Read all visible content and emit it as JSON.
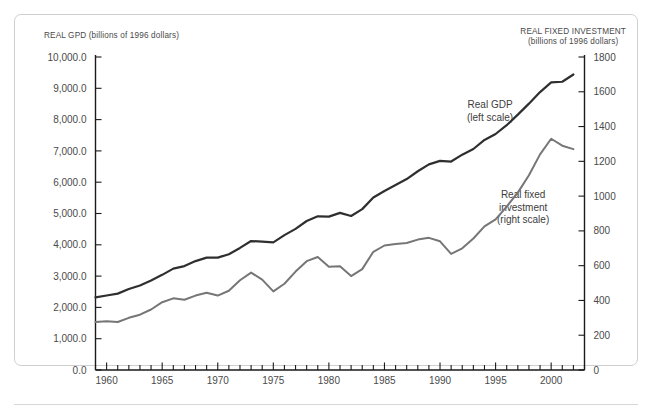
{
  "figure": {
    "left_axis_caption": "REAL GPD (billions of 1996 dollars)",
    "right_axis_caption_line1": "REAL FIXED INVESTMENT",
    "right_axis_caption_line2": "(billions of 1996 dollars)",
    "annotation_gdp_line1": "Real GDP",
    "annotation_gdp_line2": "(left scale)",
    "annotation_inv_line1": "Real fixed",
    "annotation_inv_line2": "investment",
    "annotation_inv_line3": "(right scale)"
  },
  "colors": {
    "gdp_line": "#2f2f2f",
    "investment_line": "#767676",
    "axis": "#1a1a1a",
    "text": "#4a4a4a",
    "frame": "#cfcfcf",
    "background": "#ffffff"
  },
  "chart_data": {
    "type": "line",
    "title": "",
    "subtitle": "",
    "xlabel": "",
    "ylabel": "REAL GPD (billions of 1996 dollars)",
    "y2label": "REAL FIXED INVESTMENT (billions of 1996 dollars)",
    "grid": false,
    "legend_position": "inline-annotations",
    "xlim": [
      1959,
      2003
    ],
    "ylim": [
      0,
      10000
    ],
    "y2lim": [
      0,
      1800
    ],
    "xticks": [
      1960,
      1965,
      1970,
      1975,
      1980,
      1985,
      1990,
      1995,
      2000
    ],
    "xtick_labels": [
      "1960",
      "1965",
      "1970",
      "1975",
      "1980",
      "1985",
      "1990",
      "1995",
      "2000"
    ],
    "xminor_step": 1,
    "yticks": [
      0,
      1000,
      2000,
      3000,
      4000,
      5000,
      6000,
      7000,
      8000,
      9000,
      10000
    ],
    "ytick_labels": [
      "0.0",
      "1,000.0",
      "2,000.0",
      "3,000.0",
      "4,000.0",
      "5,000.0",
      "6,000.0",
      "7,000.0",
      "8,000.0",
      "9,000.0",
      "10,000.0"
    ],
    "y2ticks": [
      0,
      200,
      400,
      600,
      800,
      1000,
      1200,
      1400,
      1600,
      1800
    ],
    "y2tick_labels": [
      "0",
      "200",
      "400",
      "600",
      "800",
      "1000",
      "1200",
      "1400",
      "1600",
      "1800"
    ],
    "x": [
      1959,
      1960,
      1961,
      1962,
      1963,
      1964,
      1965,
      1966,
      1967,
      1968,
      1969,
      1970,
      1971,
      1972,
      1973,
      1974,
      1975,
      1976,
      1977,
      1978,
      1979,
      1980,
      1981,
      1982,
      1983,
      1984,
      1985,
      1986,
      1987,
      1988,
      1989,
      1990,
      1991,
      1992,
      1993,
      1994,
      1995,
      1996,
      1997,
      1998,
      1999,
      2000,
      2001,
      2002
    ],
    "series": [
      {
        "name": "Real GDP",
        "axis": "left",
        "units": "billions of 1996 dollars",
        "color": "#2f2f2f",
        "label_line1": "Real GDP",
        "label_line2": "(left scale)",
        "values": [
          2320,
          2380,
          2440,
          2590,
          2700,
          2860,
          3040,
          3240,
          3320,
          3480,
          3590,
          3590,
          3700,
          3900,
          4120,
          4100,
          4080,
          4310,
          4510,
          4760,
          4910,
          4900,
          5020,
          4920,
          5140,
          5510,
          5720,
          5910,
          6100,
          6350,
          6570,
          6680,
          6660,
          6880,
          7060,
          7350,
          7540,
          7820,
          8160,
          8510,
          8880,
          9190,
          9210,
          9440
        ]
      },
      {
        "name": "Real fixed investment",
        "axis": "right",
        "units": "billions of 1996 dollars",
        "color": "#767676",
        "label_line1": "Real fixed",
        "label_line2": "investment",
        "label_line3": "(right scale)",
        "values": [
          276,
          280,
          276,
          300,
          318,
          348,
          390,
          412,
          404,
          428,
          444,
          428,
          456,
          516,
          560,
          520,
          452,
          496,
          566,
          626,
          650,
          594,
          596,
          540,
          580,
          680,
          716,
          724,
          730,
          750,
          760,
          740,
          668,
          700,
          756,
          826,
          866,
          940,
          1020,
          1120,
          1240,
          1330,
          1290,
          1270
        ]
      }
    ],
    "notes": [
      "Investment series plotted on right axis (0-1800).",
      "Both series rise through the period; investment peaks near 2000 then declines."
    ]
  }
}
